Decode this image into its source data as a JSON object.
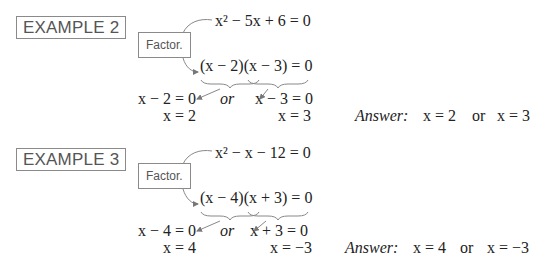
{
  "examples": [
    {
      "label": "EXAMPLE 2",
      "factor_label": "Factor.",
      "equation": "x² − 5x + 6 = 0",
      "factored": "(x − 2)(x − 3) = 0",
      "left_eq": "x − 2 = 0",
      "or_word": "or",
      "right_eq": "x − 3 = 0",
      "left_sol": "x = 2",
      "right_sol": "x = 3",
      "answer_label": "Answer:",
      "answer_left": "x = 2",
      "answer_or": "or",
      "answer_right": "x = 3"
    },
    {
      "label": "EXAMPLE 3",
      "factor_label": "Factor.",
      "equation": "x² − x − 12 = 0",
      "factored": "(x − 4)(x + 3) = 0",
      "left_eq": "x − 4 = 0",
      "or_word": "or",
      "right_eq": "x + 3 = 0",
      "left_sol": "x = 4",
      "right_sol": "x = −3",
      "answer_label": "Answer:",
      "answer_left": "x = 4",
      "answer_or": "or",
      "answer_right": "x = −3"
    }
  ]
}
